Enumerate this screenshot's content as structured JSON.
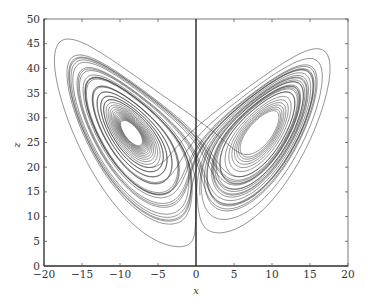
{
  "chart_data": {
    "type": "line",
    "title": "",
    "xlabel": "x",
    "ylabel": "z",
    "xlim": [
      -20,
      20
    ],
    "ylim": [
      0,
      50
    ],
    "xticks": [
      -20,
      -15,
      -10,
      -5,
      0,
      5,
      10,
      15,
      20
    ],
    "yticks": [
      0,
      5,
      10,
      15,
      20,
      25,
      30,
      35,
      40,
      45,
      50
    ],
    "grid": false,
    "legend": null,
    "series": [
      {
        "name": "Lorenz attractor trajectory (x vs z)",
        "system": "lorenz",
        "params": {
          "sigma": 10,
          "rho": 28,
          "beta": 2.6667
        },
        "initial": [
          0.5,
          1.0,
          1.0
        ],
        "dt": 0.004,
        "steps": 12000,
        "color": "#2a2a2a"
      }
    ],
    "annotations": [
      {
        "type": "vline",
        "x": 0,
        "color": "#111111"
      }
    ],
    "approx_features": {
      "left_lobe_center": [
        -8.5,
        27
      ],
      "right_lobe_center": [
        8.5,
        27
      ],
      "x_range": [
        -17,
        18
      ],
      "z_range": [
        5,
        45
      ]
    }
  },
  "colors": {
    "axis": "#444444",
    "line": "#2a2a2a",
    "vline": "#111111"
  }
}
